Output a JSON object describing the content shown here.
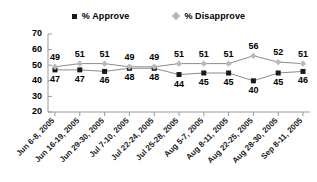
{
  "legend": {
    "position": "top-center",
    "entries": [
      {
        "label": "% Approve",
        "marker": "square-marker-icon",
        "color": "#1a1a1a"
      },
      {
        "label": "% Disapprove",
        "marker": "diamond-marker-icon",
        "color": "#b4b4b4"
      }
    ]
  },
  "chart_data": {
    "type": "line",
    "title": "",
    "subtitle": "",
    "xlabel": "",
    "ylabel": "",
    "ylim": [
      20,
      70
    ],
    "yticks": [
      20,
      30,
      40,
      50,
      60,
      70
    ],
    "grid": false,
    "legend_position": "top-center",
    "categories": [
      "Jun 6-8, 2005",
      "Jun 16-19, 2005",
      "Jun 29-30, 2005",
      "Jul 7-10, 2005",
      "Jul 22-24, 2005",
      "Jul 25-28, 2005",
      "Aug 5-7, 2005",
      "Aug 8-11, 2005",
      "Aug 22-25, 2005",
      "Aug 28-30, 2005",
      "Sep 8-11, 2005"
    ],
    "series": [
      {
        "name": "% Approve",
        "color": "#1a1a1a",
        "marker": "square",
        "label_position": "below",
        "values": [
          47,
          47,
          46,
          48,
          48,
          44,
          45,
          45,
          40,
          45,
          46
        ]
      },
      {
        "name": "% Disapprove",
        "color": "#b4b4b4",
        "marker": "diamond",
        "label_position": "above",
        "values": [
          49,
          51,
          51,
          49,
          49,
          51,
          51,
          51,
          56,
          52,
          51
        ]
      }
    ]
  }
}
